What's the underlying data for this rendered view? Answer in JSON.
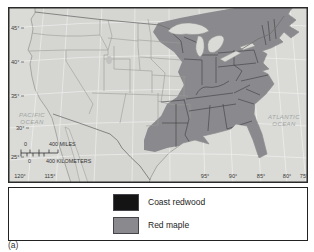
{
  "figure": {
    "caption": "(a)",
    "map": {
      "latitude_labels": [
        "45°",
        "40°",
        "35°",
        "30°",
        "25°"
      ],
      "longitude_labels": [
        "120°",
        "115°",
        "95°",
        "90°",
        "85°",
        "80°",
        "75°"
      ],
      "ocean_labels": {
        "pacific_line1": "PACIFIC",
        "pacific_line2": "OCEAN",
        "atlantic_line1": "ATLANTIC",
        "atlantic_line2": "OCEAN"
      },
      "scale_bar": {
        "miles_start": "0",
        "miles_end": "400 MILES",
        "km_start": "0",
        "km_end": "400 KILOMETERS"
      },
      "colors": {
        "ocean": "#dadbd7",
        "land": "#d5d6d2",
        "red_maple": "#8a8a8e",
        "coast_redwood": "#141414",
        "state_line": "#9c9c98",
        "state_line_dark": "#3c3c42",
        "country_border": "#6f6f6d",
        "graticule": "#ffffff",
        "frame": "#2b2b2b"
      }
    },
    "legend": {
      "items": [
        {
          "label": "Coast redwood",
          "color": "#141414"
        },
        {
          "label": "Red maple",
          "color": "#8a8a8e"
        }
      ]
    }
  }
}
